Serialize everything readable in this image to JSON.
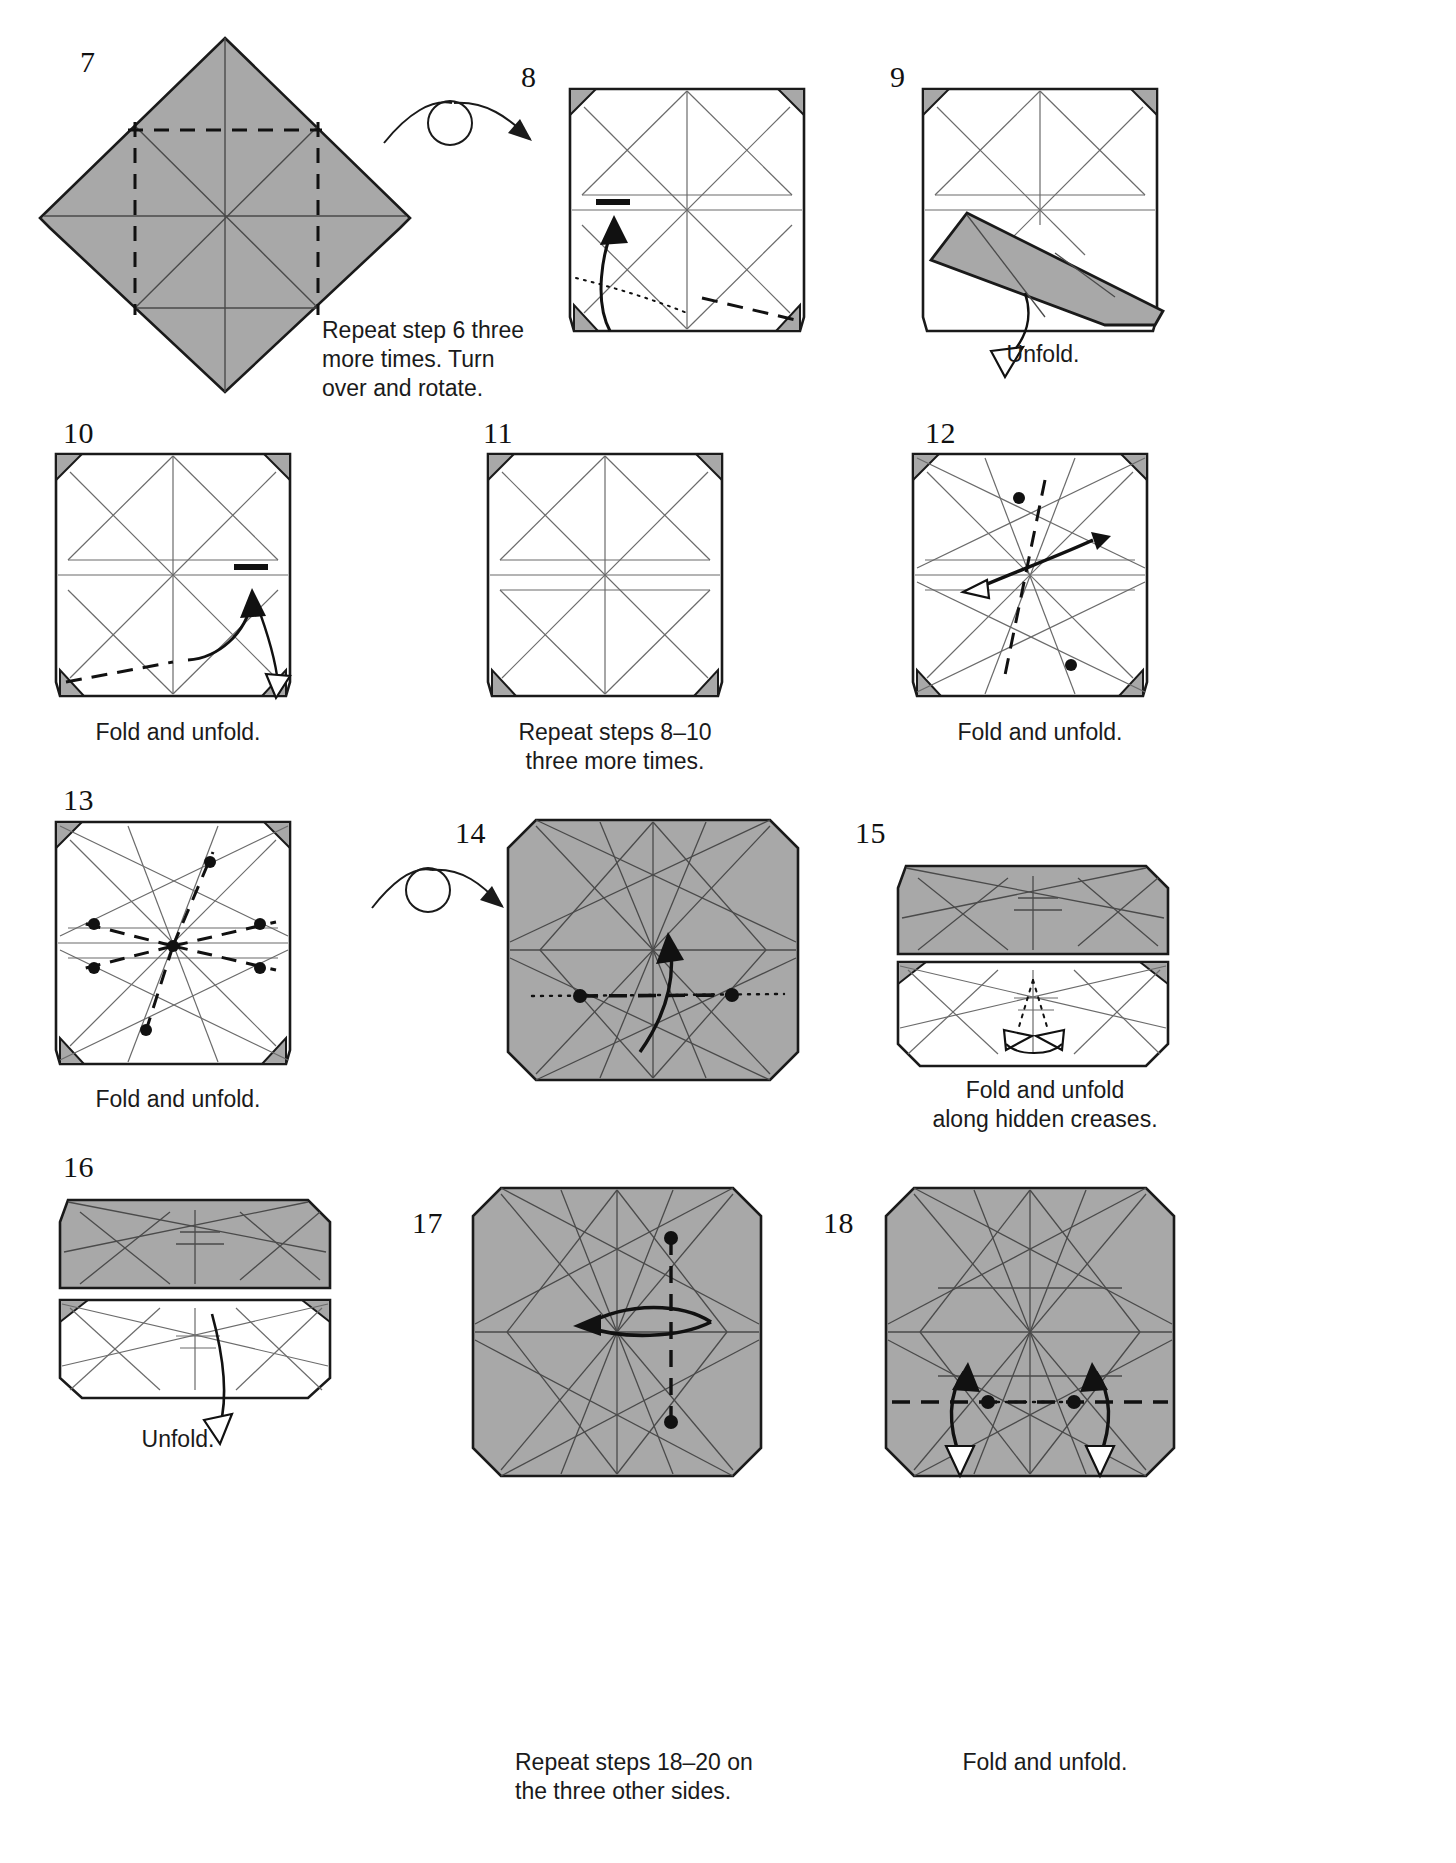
{
  "document": {
    "type": "origami-instruction-diagram",
    "page_background": "#ffffff",
    "paper_front_color": "#a8a8a8",
    "paper_back_color": "#ffffff",
    "line_color": "#1a1a1a",
    "crease_color": "#6b6b6b"
  },
  "steps": [
    {
      "number": "7",
      "caption": "Repeat step 6 three\nmore times. Turn\nover and rotate.",
      "shape": "diamond",
      "fill": "front",
      "symbols": [
        "valley-fold-dashed-lines",
        "existing-creases"
      ]
    },
    {
      "number": "8",
      "caption": "",
      "shape": "square",
      "fill": "back",
      "symbols": [
        "turn-over-arrow",
        "fold-arrow",
        "x-ray-dotted-line",
        "valley-fold-dashed",
        "corner-flaps"
      ]
    },
    {
      "number": "9",
      "caption": "Unfold.",
      "shape": "square-with-flap",
      "fill": "back",
      "symbols": [
        "gray-flap",
        "hollow-unfold-arrow",
        "corner-flaps"
      ]
    },
    {
      "number": "10",
      "caption": "Fold and unfold.",
      "shape": "square",
      "fill": "back",
      "symbols": [
        "fold-unfold-arrow",
        "valley-fold-dashed",
        "corner-flaps"
      ]
    },
    {
      "number": "11",
      "caption": "Repeat steps 8–10\nthree more times.",
      "shape": "square",
      "fill": "back",
      "symbols": [
        "creases",
        "corner-flaps"
      ]
    },
    {
      "number": "12",
      "caption": "Fold and unfold.",
      "shape": "square",
      "fill": "back",
      "symbols": [
        "double-headed-arrow",
        "valley-fold-dashed",
        "reference-dots",
        "corner-flaps"
      ]
    },
    {
      "number": "13",
      "caption": "Fold and unfold.",
      "shape": "square",
      "fill": "back",
      "symbols": [
        "radial-dashed-creases",
        "reference-dots",
        "corner-flaps"
      ]
    },
    {
      "number": "14",
      "caption": "",
      "shape": "octagon",
      "fill": "front",
      "symbols": [
        "turn-over-arrow",
        "fold-arrow",
        "horizontal-dashed-line",
        "reference-dots",
        "dotted-line"
      ]
    },
    {
      "number": "15",
      "caption": "Fold and unfold\nalong hidden creases.",
      "shape": "folded-band",
      "fill": "front",
      "symbols": [
        "hollow-arrows",
        "hidden-crease-dotted"
      ]
    },
    {
      "number": "16",
      "caption": "Unfold.",
      "shape": "folded-band",
      "fill": "front",
      "symbols": [
        "hollow-unfold-arrow"
      ]
    },
    {
      "number": "17",
      "caption": "Repeat steps 18–20 on\nthe three other sides.",
      "shape": "octagon",
      "fill": "front",
      "symbols": [
        "double-headed-arrow",
        "vertical-dashed-line",
        "reference-dots"
      ]
    },
    {
      "number": "18",
      "caption": "Fold and unfold.",
      "shape": "octagon",
      "fill": "front",
      "symbols": [
        "two-fold-arrows",
        "horizontal-dashed-line",
        "reference-dots",
        "hollow-arrowheads"
      ]
    }
  ]
}
